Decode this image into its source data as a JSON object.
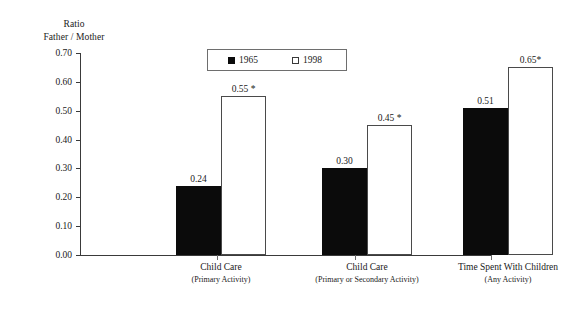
{
  "chart_data": {
    "type": "bar",
    "title": "",
    "xlabel": "",
    "ylabel": "Ratio\nFather / Mother",
    "ylabel_lines": [
      "Ratio",
      "Father / Mother"
    ],
    "ylim": [
      0.0,
      0.7
    ],
    "ytick_labels": [
      "0.70",
      "0.60",
      "0.50",
      "0.40",
      "0.30",
      "0.20",
      "0.10",
      "0.00"
    ],
    "ytick_values": [
      0.7,
      0.6,
      0.5,
      0.4,
      0.3,
      0.2,
      0.1,
      0.0
    ],
    "grid": false,
    "legend_position": "top-center",
    "categories": [
      "Child Care (Primary Activity)",
      "Child Care (Primary or Secondary Activity)",
      "Time Spent With Children (Any Activity)"
    ],
    "category_labels": [
      {
        "main": "Child Care",
        "sub": "(Primary Activity)"
      },
      {
        "main": "Child Care",
        "sub": "(Primary or Secondary Activity)"
      },
      {
        "main": "Time Spent With Children",
        "sub": "(Any Activity)"
      }
    ],
    "series": [
      {
        "name": "1965",
        "color": "#0b0b0b",
        "values": [
          0.24,
          0.3,
          0.51
        ],
        "value_labels": [
          "0.24",
          "0.30",
          "0.51"
        ]
      },
      {
        "name": "1998",
        "color": "#ffffff",
        "values": [
          0.55,
          0.45,
          0.65
        ],
        "value_labels": [
          "0.55 *",
          "0.45 *",
          "0.65*"
        ]
      }
    ],
    "annotations": [
      {
        "text": "*",
        "meaning": "significance marker on 1998 bars"
      }
    ]
  },
  "legend": {
    "items": [
      {
        "label": "1965",
        "swatch": "filled-square"
      },
      {
        "label": "1998",
        "swatch": "open-square"
      }
    ]
  }
}
